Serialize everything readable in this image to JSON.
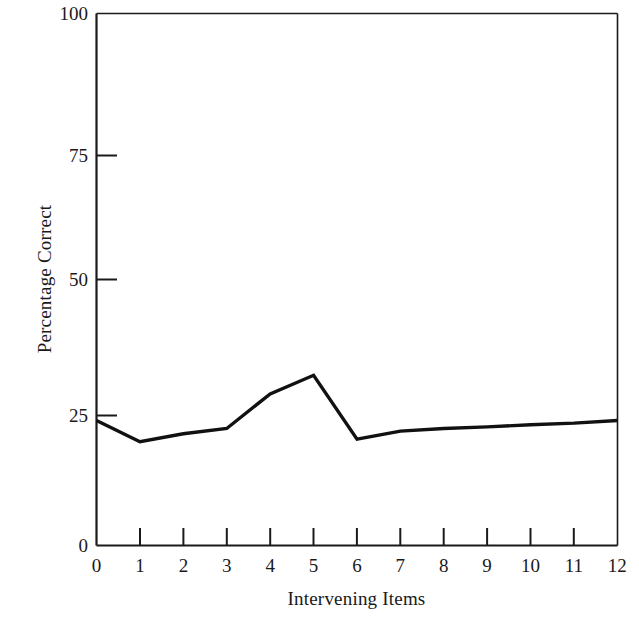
{
  "chart_data": {
    "type": "line",
    "title": "",
    "xlabel": "Intervening Items",
    "ylabel": "Percentage Correct",
    "x": [
      0,
      1,
      2,
      3,
      4,
      5,
      6,
      7,
      8,
      9,
      10,
      11,
      12
    ],
    "values": [
      23.5,
      19.5,
      21,
      22,
      28.5,
      32,
      20,
      21.5,
      22,
      22.3,
      22.7,
      23,
      23.5
    ],
    "series": [
      {
        "name": "Percentage Correct",
        "values": [
          23.5,
          19.5,
          21,
          22,
          28.5,
          32,
          20,
          21.5,
          22,
          22.3,
          22.7,
          23,
          23.5
        ]
      }
    ],
    "xlim": [
      0,
      12
    ],
    "ylim": [
      0,
      100
    ],
    "x_ticks": [
      0,
      1,
      2,
      3,
      4,
      5,
      6,
      7,
      8,
      9,
      10,
      11,
      12
    ],
    "x_tick_labels": [
      "0",
      "1",
      "2",
      "3",
      "4",
      "5",
      "6",
      "7",
      "8",
      "9",
      "10",
      "11",
      "12"
    ],
    "y_ticks": [
      0,
      25,
      50,
      75,
      100
    ],
    "y_tick_labels": [
      "0",
      "25",
      "50",
      "75",
      "100"
    ],
    "grid": false,
    "legend": false,
    "legend_position": "none",
    "line_color": "#111111",
    "axis_color": "#1a1a1a",
    "background_color": "#ffffff",
    "markers": false
  }
}
